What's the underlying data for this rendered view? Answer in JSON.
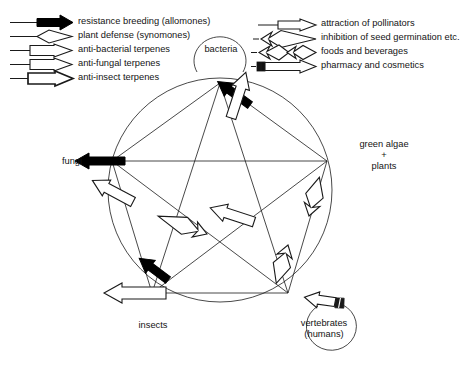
{
  "figure": {
    "type": "diagram",
    "kind": "pentagram-interaction-network",
    "background": "#ffffff",
    "stroke_color": "#1a1a1a",
    "fill_white": "#ffffff",
    "fill_black": "#000000"
  },
  "legend": {
    "left": {
      "items": [
        {
          "label": "resistance breeding (allomones)",
          "icon": "solid-black-arrow-icon",
          "style": "solid-black",
          "tail": "plain-line"
        },
        {
          "label": "plant defense (synomones)",
          "icon": "open-white-arrow-icon",
          "style": "open-white",
          "tail": "plain-line"
        },
        {
          "label": "anti-bacterial terpenes",
          "icon": "open-white-block-arrow-icon",
          "style": "open-white-box",
          "tail": "plain-line"
        },
        {
          "label": "anti-fungal terpenes",
          "icon": "open-white-block-arrow-icon",
          "style": "open-white-box",
          "tail": "plain-line"
        },
        {
          "label": "anti-insect terpenes",
          "icon": "open-white-bold-arrow-icon",
          "style": "open-white-bold",
          "tail": "plain-line"
        }
      ]
    },
    "right": {
      "items": [
        {
          "label": "attraction of pollinators",
          "icon": "open-white-slim-arrow-icon",
          "style": "open-white-slim",
          "tail": "plain-line"
        },
        {
          "label": "inhibition of seed germination etc.",
          "icon": "jagged-open-arrow-icon",
          "style": "jagged-open",
          "tail": "short-dash"
        },
        {
          "label": "foods and beverages",
          "icon": "double-jagged-arrow-icon",
          "style": "double-jagged",
          "tail": "short-dash"
        },
        {
          "label": "pharmacy and cosmetics",
          "icon": "capsule-tail-arrow-icon",
          "style": "capsule-tail",
          "tail": "short-dash"
        }
      ]
    }
  },
  "nodes": [
    {
      "id": "bacteria",
      "label": "bacteria",
      "label2": "",
      "x": 220,
      "y": 83,
      "tx": 220,
      "ty": 48
    },
    {
      "id": "green-algae",
      "label": "green algae",
      "label2": "+",
      "label3": "plants",
      "x": 327,
      "y": 161,
      "tx": 385,
      "ty": 145
    },
    {
      "id": "vertebrates",
      "label": "vertebrates",
      "label2": "(humans)",
      "x": 288,
      "y": 293,
      "tx": 330,
      "ty": 325
    },
    {
      "id": "insects",
      "label": "insects",
      "label2": "",
      "x": 152,
      "y": 293,
      "tx": 152,
      "ty": 326
    },
    {
      "id": "fungi",
      "label": "fungi",
      "label2": "",
      "x": 112,
      "y": 161,
      "tx": 72,
      "ty": 161
    }
  ],
  "circle": {
    "cx": 220,
    "cy": 190,
    "r": 112
  },
  "edges": [
    {
      "from": "green-algae",
      "to": "bacteria",
      "relation": "resistance breeding (allomones)",
      "arrow": "solid-black"
    },
    {
      "from": "green-algae",
      "to": "fungi",
      "relation": "resistance breeding (allomones)",
      "arrow": "solid-black"
    },
    {
      "from": "green-algae",
      "to": "insects",
      "relation": "resistance breeding (allomones)",
      "arrow": "solid-black"
    },
    {
      "from": "insects",
      "to": "bacteria",
      "relation": "plant defense (synomones)",
      "arrow": "open-white"
    },
    {
      "from": "fungi",
      "to": "insects",
      "relation": "anti-fungal terpenes",
      "arrow": "open-white"
    },
    {
      "from": "vertebrates",
      "to": "insects",
      "relation": "attraction of pollinators",
      "arrow": "open-white"
    },
    {
      "from": "green-algae",
      "to": "vertebrates",
      "relation": "anti-insect terpenes",
      "arrow": "open-white"
    },
    {
      "from": "green-algae",
      "to": "insects",
      "relation": "inhibition of seed germination etc.",
      "arrow": "jagged-open"
    },
    {
      "from": "vertebrates",
      "to": "green-algae",
      "relation": "foods and beverages",
      "arrow": "double-jagged"
    },
    {
      "from": "green-algae",
      "to": "vertebrates",
      "relation": "foods and beverages",
      "arrow": "double-jagged"
    },
    {
      "from": "vertebrates",
      "to": "vertebrates",
      "relation": "pharmacy and cosmetics",
      "arrow": "capsule-tail"
    },
    {
      "from": "bacteria",
      "to": "bacteria",
      "relation": "self-loop",
      "arrow": "plain"
    }
  ]
}
